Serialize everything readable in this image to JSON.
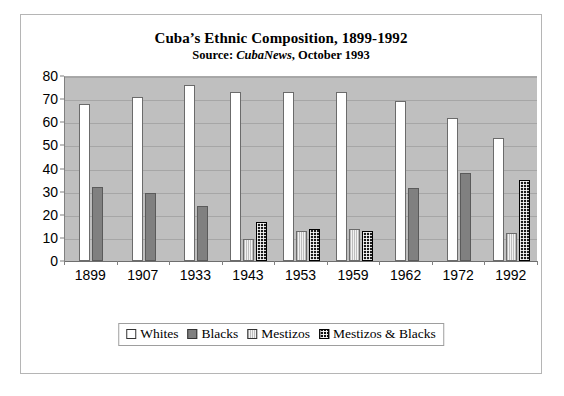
{
  "chart_data": {
    "type": "bar",
    "title": "Cuba’s Ethnic Composition, 1899-1992",
    "subtitle_prefix": "Source: ",
    "subtitle_italic": "CubaNews",
    "subtitle_suffix": ", October 1993",
    "xlabel": "",
    "ylabel": "",
    "ylim": [
      0,
      80
    ],
    "yticks": [
      0,
      10,
      20,
      30,
      40,
      50,
      60,
      70,
      80
    ],
    "grid": true,
    "legend_position": "bottom",
    "categories": [
      "1899",
      "1907",
      "1933",
      "1943",
      "1953",
      "1959",
      "1962",
      "1972",
      "1992"
    ],
    "series": [
      {
        "name": "Whites",
        "color": "#ffffff",
        "pattern": "solid",
        "values": [
          68,
          71,
          76,
          73,
          73,
          73,
          69,
          62,
          53
        ]
      },
      {
        "name": "Blacks",
        "color": "#808080",
        "pattern": "solid",
        "values": [
          32,
          29.5,
          24,
          null,
          null,
          null,
          31.5,
          38,
          null
        ]
      },
      {
        "name": "Mestizos",
        "color": "#e3e3e3",
        "pattern": "fine-lines",
        "values": [
          null,
          null,
          null,
          9.5,
          13,
          14,
          null,
          null,
          12
        ]
      },
      {
        "name": "Mestizos & Blacks",
        "color": "#1a1a1a",
        "pattern": "checkered",
        "values": [
          null,
          null,
          null,
          17,
          14,
          13,
          null,
          null,
          35
        ]
      }
    ]
  },
  "legend": {
    "items": [
      {
        "label": "Whites"
      },
      {
        "label": "Blacks"
      },
      {
        "label": "Mestizos"
      },
      {
        "label": "Mestizos & Blacks"
      }
    ]
  }
}
